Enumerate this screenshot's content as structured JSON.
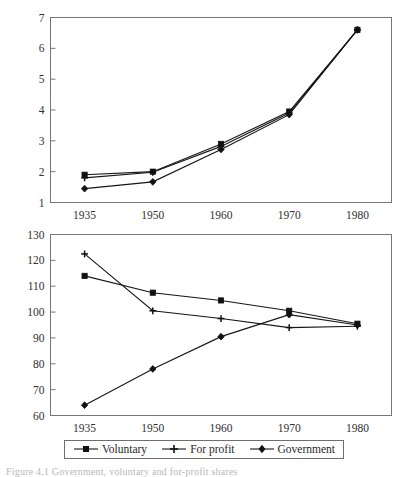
{
  "figure": {
    "caption": "Figure 4.1 Government, voluntary and for-profit shares"
  },
  "legend": {
    "position": "bottom-center",
    "entries": [
      {
        "label": "Voluntary",
        "marker": "square"
      },
      {
        "label": "For profit",
        "marker": "plus"
      },
      {
        "label": "Government",
        "marker": "diamond"
      }
    ]
  },
  "chart_data": [
    {
      "type": "line",
      "title": "",
      "xlabel": "",
      "ylabel": "",
      "categories": [
        "1935",
        "1950",
        "1960",
        "1970",
        "1980"
      ],
      "xticklabels": [
        "1935",
        "1950",
        "1960",
        "1970",
        "1980"
      ],
      "yticks": [
        1,
        2,
        3,
        4,
        5,
        6,
        7
      ],
      "yticklabels": [
        "1",
        "2",
        "3",
        "4",
        "5",
        "6",
        "7"
      ],
      "ylim": [
        1,
        7
      ],
      "grid": false,
      "series": [
        {
          "name": "Voluntary",
          "marker": "square",
          "values": [
            1.9,
            2.0,
            2.9,
            3.95,
            6.6
          ]
        },
        {
          "name": "For profit",
          "marker": "plus",
          "values": [
            1.8,
            1.98,
            2.82,
            3.9,
            6.6
          ]
        },
        {
          "name": "Government",
          "marker": "diamond",
          "values": [
            1.45,
            1.67,
            2.72,
            3.85,
            6.6
          ]
        }
      ]
    },
    {
      "type": "line",
      "title": "",
      "xlabel": "",
      "ylabel": "",
      "categories": [
        "1935",
        "1950",
        "1960",
        "1970",
        "1980"
      ],
      "xticklabels": [
        "1935",
        "1950",
        "1960",
        "1970",
        "1980"
      ],
      "yticks": [
        60,
        70,
        80,
        90,
        100,
        110,
        120,
        130
      ],
      "yticklabels": [
        "60",
        "70",
        "80",
        "90",
        "100",
        "110",
        "120",
        "130"
      ],
      "ylim": [
        60,
        130
      ],
      "grid": false,
      "series": [
        {
          "name": "Voluntary",
          "marker": "square",
          "values": [
            114,
            107.5,
            104.5,
            100.5,
            95.5
          ]
        },
        {
          "name": "For profit",
          "marker": "plus",
          "values": [
            122.5,
            100.5,
            97.5,
            94,
            94.5
          ]
        },
        {
          "name": "Government",
          "marker": "diamond",
          "values": [
            64,
            78,
            90.5,
            99,
            95
          ]
        }
      ]
    }
  ]
}
